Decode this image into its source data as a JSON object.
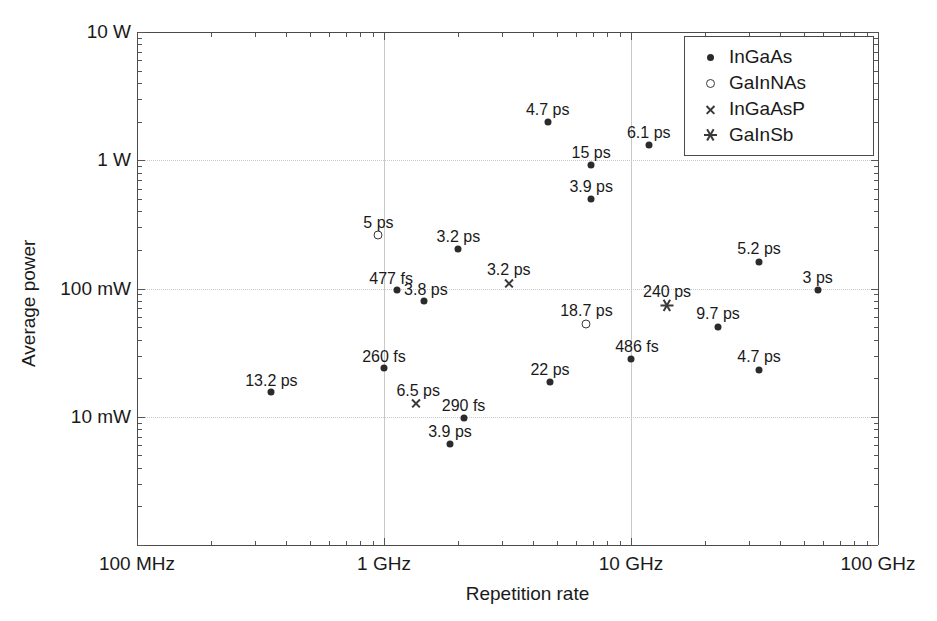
{
  "chart_data": {
    "type": "scatter",
    "title": "",
    "xlabel": "Repetition rate",
    "ylabel": "Average power",
    "xscale": "log",
    "yscale": "log",
    "xlim_hz": [
      100000000,
      100000000000
    ],
    "ylim_w": [
      0.001,
      10
    ],
    "xticks": [
      "100 MHz",
      "1 GHz",
      "10 GHz",
      "100 GHz"
    ],
    "yticks": [
      "10 W",
      "1 W",
      "100 mW",
      "10 mW"
    ],
    "grid": "dotted horizontal at 1 W, 100 mW, 10 mW; solid vertical at 1 GHz and 10 GHz",
    "legend_position": "top-right inside axes",
    "legend": [
      {
        "marker": "dot",
        "label": "InGaAs"
      },
      {
        "marker": "open-circle",
        "label": "GaInNAs"
      },
      {
        "marker": "cross",
        "label": "InGaAsP"
      },
      {
        "marker": "asterisk",
        "label": "GaInSb"
      }
    ],
    "points": [
      {
        "label": "13.2 ps",
        "series": "InGaAs",
        "x_ghz": 0.35,
        "y_w": 0.0155,
        "lx": 0,
        "ly": -20
      },
      {
        "label": "260 fs",
        "series": "InGaAs",
        "x_ghz": 1.0,
        "y_w": 0.024,
        "lx": 0,
        "ly": -20
      },
      {
        "label": "5 ps",
        "series": "GaInNAs",
        "x_ghz": 0.95,
        "y_w": 0.26,
        "lx": 0,
        "ly": -21
      },
      {
        "label": "477 fs",
        "series": "InGaAs",
        "x_ghz": 1.13,
        "y_w": 0.098,
        "lx": -6,
        "ly": -20
      },
      {
        "label": "3.8 ps",
        "series": "InGaAs",
        "x_ghz": 1.45,
        "y_w": 0.08,
        "lx": 2,
        "ly": -20
      },
      {
        "label": "6.5 ps",
        "series": "InGaAsP",
        "x_ghz": 1.35,
        "y_w": 0.0128,
        "lx": 2,
        "ly": -21
      },
      {
        "label": "3.9 ps",
        "series": "InGaAs",
        "x_ghz": 1.85,
        "y_w": 0.0061,
        "lx": 0,
        "ly": -21
      },
      {
        "label": "3.2 ps",
        "series": "InGaAs",
        "x_ghz": 2.0,
        "y_w": 0.205,
        "lx": 0,
        "ly": -21
      },
      {
        "label": "290 fs",
        "series": "InGaAs",
        "x_ghz": 2.1,
        "y_w": 0.0098,
        "lx": 0,
        "ly": -21
      },
      {
        "label": "3.2 ps",
        "series": "InGaAsP",
        "x_ghz": 3.2,
        "y_w": 0.11,
        "lx": 0,
        "ly": -22
      },
      {
        "label": "4.7 ps",
        "series": "InGaAs",
        "x_ghz": 4.6,
        "y_w": 2.0,
        "lx": 0,
        "ly": -21
      },
      {
        "label": "22 ps",
        "series": "InGaAs",
        "x_ghz": 4.7,
        "y_w": 0.0185,
        "lx": 0,
        "ly": -21
      },
      {
        "label": "18.7 ps",
        "series": "GaInNAs",
        "x_ghz": 6.6,
        "y_w": 0.053,
        "lx": 0,
        "ly": -22
      },
      {
        "label": "15 ps",
        "series": "InGaAs",
        "x_ghz": 6.9,
        "y_w": 0.92,
        "lx": 0,
        "ly": -21
      },
      {
        "label": "3.9 ps",
        "series": "InGaAs",
        "x_ghz": 6.9,
        "y_w": 0.5,
        "lx": 0,
        "ly": -21
      },
      {
        "label": "486 fs",
        "series": "InGaAs",
        "x_ghz": 10.0,
        "y_w": 0.028,
        "lx": 6,
        "ly": -21
      },
      {
        "label": "6.1 ps",
        "series": "InGaAs",
        "x_ghz": 11.8,
        "y_w": 1.32,
        "lx": 0,
        "ly": -21
      },
      {
        "label": "240 ps",
        "series": "GaInSb",
        "x_ghz": 14.0,
        "y_w": 0.074,
        "lx": 0,
        "ly": -22
      },
      {
        "label": "9.7 ps",
        "series": "InGaAs",
        "x_ghz": 22.5,
        "y_w": 0.05,
        "lx": 0,
        "ly": -22
      },
      {
        "label": "4.7 ps",
        "series": "InGaAs",
        "x_ghz": 33.0,
        "y_w": 0.023,
        "lx": 0,
        "ly": -22
      },
      {
        "label": "5.2 ps",
        "series": "InGaAs",
        "x_ghz": 33.0,
        "y_w": 0.16,
        "lx": 0,
        "ly": -22
      },
      {
        "label": "3 ps",
        "series": "InGaAs",
        "x_ghz": 57.0,
        "y_w": 0.097,
        "lx": 0,
        "ly": -21
      }
    ]
  },
  "axes": {
    "y_title": "Average power",
    "x_title": "Repetition rate"
  }
}
